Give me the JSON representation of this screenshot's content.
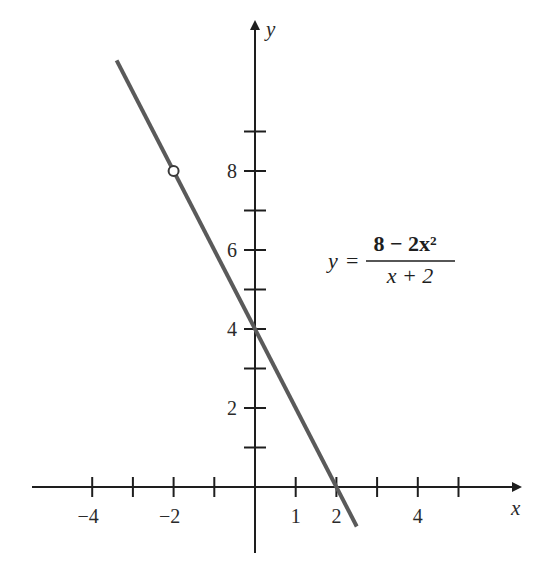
{
  "chart_data": {
    "type": "line",
    "title": "",
    "xlabel": "x",
    "ylabel": "y",
    "equation": {
      "lhs": "y",
      "equals": "=",
      "numerator": "8 − 2x²",
      "denominator": "x + 2"
    },
    "xlim": [
      -5.5,
      6.5
    ],
    "ylim": [
      -1.6,
      11.5
    ],
    "x_ticks": [
      -4,
      -3,
      -2,
      -1,
      1,
      2,
      3,
      4,
      5
    ],
    "x_tick_labels": [
      {
        "value": -4,
        "label": "−4"
      },
      {
        "value": -2,
        "label": "−2"
      },
      {
        "value": 1,
        "label": "1"
      },
      {
        "value": 2,
        "label": "2"
      },
      {
        "value": 4,
        "label": "4"
      }
    ],
    "y_ticks": [
      1,
      2,
      3,
      4,
      5,
      6,
      7,
      8,
      9
    ],
    "y_tick_labels": [
      {
        "value": 2,
        "label": "2"
      },
      {
        "value": 4,
        "label": "4"
      },
      {
        "value": 6,
        "label": "6"
      },
      {
        "value": 8,
        "label": "8"
      }
    ],
    "series": [
      {
        "name": "y = (8 − 2x²)/(x + 2)",
        "simplified": "y = 4 − 2x, x ≠ −2",
        "x": [
          -3.4,
          2.5
        ],
        "y": [
          10.8,
          -1.0
        ],
        "color": "#5a5a5a"
      }
    ],
    "open_points": [
      {
        "x": -2,
        "y": 8,
        "note": "hole (undefined at x = −2)"
      }
    ],
    "intercepts": {
      "y_intercept": {
        "x": 0,
        "y": 4
      },
      "x_intercept": {
        "x": 2,
        "y": 0
      }
    },
    "grid": false,
    "legend": null
  }
}
